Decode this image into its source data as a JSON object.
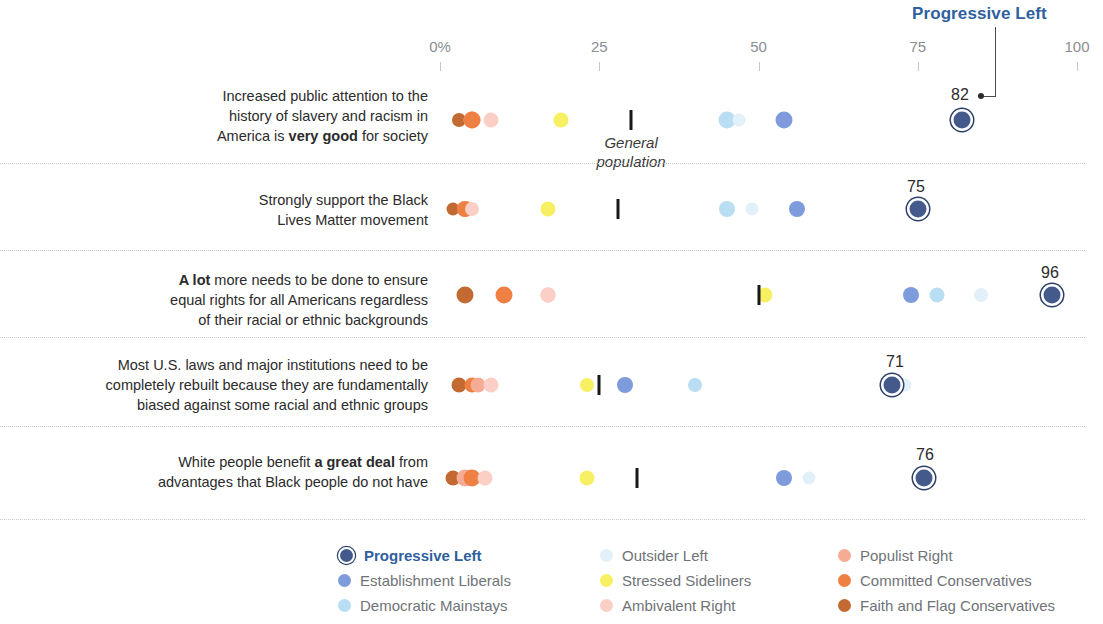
{
  "callout": {
    "title": "Progressive Left",
    "value": "82",
    "color": "#2f5f9e"
  },
  "axis": {
    "ticks": [
      {
        "label": "0%",
        "value": 0
      },
      {
        "label": "25",
        "value": 25
      },
      {
        "label": "50",
        "value": 50
      },
      {
        "label": "75",
        "value": 75
      },
      {
        "label": "100",
        "value": 100
      }
    ],
    "min": 0,
    "max": 100
  },
  "genpop_note": {
    "line1": "General",
    "line2": "population"
  },
  "groups": [
    {
      "key": "progressive_left",
      "label": "Progressive Left",
      "color": "#44598c",
      "ring": true
    },
    {
      "key": "establishment_liberals",
      "label": "Establishment Liberals",
      "color": "#7e9bdc",
      "ring": false
    },
    {
      "key": "democratic_mainstays",
      "label": "Democratic Mainstays",
      "color": "#b9ddf2",
      "ring": false
    },
    {
      "key": "outsider_left",
      "label": "Outsider Left",
      "color": "#e2f0fa",
      "ring": false
    },
    {
      "key": "stressed_sideliners",
      "label": "Stressed Sideliners",
      "color": "#f6f062",
      "ring": false
    },
    {
      "key": "ambivalent_right",
      "label": "Ambivalent Right",
      "color": "#fbcfc6",
      "ring": false
    },
    {
      "key": "populist_right",
      "label": "Populist Right",
      "color": "#f6ab95",
      "ring": false
    },
    {
      "key": "committed_conservatives",
      "label": "Committed Conservatives",
      "color": "#ef8043",
      "ring": false
    },
    {
      "key": "faith_and_flag",
      "label": "Faith and Flag Conservatives",
      "color": "#c26a32",
      "ring": false
    }
  ],
  "legend": {
    "columns": [
      [
        "progressive_left",
        "establishment_liberals",
        "democratic_mainstays"
      ],
      [
        "outsider_left",
        "stressed_sideliners",
        "ambivalent_right"
      ],
      [
        "populist_right",
        "committed_conservatives",
        "faith_and_flag"
      ]
    ],
    "highlight_key": "progressive_left"
  },
  "chart_data": {
    "type": "scatter",
    "title": "",
    "xlabel": "",
    "ylabel": "",
    "xlim": [
      0,
      100
    ],
    "grid": false,
    "legend_position": "bottom",
    "categories": [
      "Increased public attention to the history of slavery and racism in America is very good for society",
      "Strongly support the Black Lives Matter movement",
      "A lot more needs to be done to ensure equal rights for all Americans regardless of their racial or ethnic backgrounds",
      "Most U.S. laws and major institutions need to be completely rebuilt because they are fundamentally biased against some racial and ethnic groups",
      "White people benefit a great deal from advantages that Black people do not have"
    ],
    "series": [
      {
        "name": "Progressive Left",
        "values": [
          82,
          75,
          96,
          71,
          76
        ]
      },
      {
        "name": "Establishment Liberals",
        "values": [
          54,
          56,
          74,
          29,
          54
        ]
      },
      {
        "name": "Democratic Mainstays",
        "values": [
          45,
          46,
          78,
          40,
          47
        ]
      },
      {
        "name": "Outsider Left",
        "values": [
          47,
          49,
          85,
          34,
          51
        ]
      },
      {
        "name": "Stressed Sideliners",
        "values": [
          19,
          17,
          18,
          23,
          23
        ]
      },
      {
        "name": "Ambivalent Right",
        "values": [
          8,
          5,
          17,
          8,
          7
        ]
      },
      {
        "name": "Populist Right",
        "values": [
          5,
          4,
          10,
          6,
          4
        ]
      },
      {
        "name": "Committed Conservatives",
        "values": [
          5,
          4,
          10,
          5,
          5
        ]
      },
      {
        "name": "Faith and Flag Conservatives",
        "values": [
          3,
          2,
          4,
          3,
          2
        ]
      }
    ],
    "general_population": [
      30,
      28,
      50,
      25,
      31
    ]
  },
  "rows": [
    {
      "label_html": "Increased public attention to the<br>history of slavery and racism in<br>America is <b>very good</b> for society",
      "label_top": 86,
      "plot_y": 120,
      "sep_y": 163,
      "value_label": "82",
      "value_label_x": 960,
      "value_label_y": 86,
      "genpop": 30,
      "show_genpop_note": true,
      "dots": [
        {
          "key": "faith_and_flag",
          "x": 3,
          "size": 14
        },
        {
          "key": "populist_right",
          "x": 5,
          "size": 17
        },
        {
          "key": "committed_conservatives",
          "x": 5,
          "size": 17
        },
        {
          "key": "ambivalent_right",
          "x": 8,
          "size": 15
        },
        {
          "key": "stressed_sideliners",
          "x": 19,
          "size": 15
        },
        {
          "key": "democratic_mainstays",
          "x": 45,
          "size": 17
        },
        {
          "key": "outsider_left",
          "x": 47,
          "size": 13
        },
        {
          "key": "establishment_liberals",
          "x": 54,
          "size": 17
        },
        {
          "key": "progressive_left",
          "x": 82,
          "size": 17
        }
      ]
    },
    {
      "label_html": "Strongly support the Black<br>Lives Matter movement",
      "label_top": 190,
      "plot_y": 209,
      "sep_y": 250,
      "value_label": "75",
      "value_label_x": 916,
      "value_label_y": 178,
      "genpop": 28,
      "show_genpop_note": false,
      "dots": [
        {
          "key": "faith_and_flag",
          "x": 2,
          "size": 13
        },
        {
          "key": "populist_right",
          "x": 4,
          "size": 16
        },
        {
          "key": "committed_conservatives",
          "x": 4,
          "size": 16
        },
        {
          "key": "ambivalent_right",
          "x": 5,
          "size": 14
        },
        {
          "key": "stressed_sideliners",
          "x": 17,
          "size": 15
        },
        {
          "key": "democratic_mainstays",
          "x": 45,
          "size": 16
        },
        {
          "key": "outsider_left",
          "x": 49,
          "size": 13
        },
        {
          "key": "establishment_liberals",
          "x": 56,
          "size": 16
        },
        {
          "key": "progressive_left",
          "x": 75,
          "size": 17
        }
      ]
    },
    {
      "label_html": "<b>A lot</b> more needs to be done to ensure<br>equal rights for all Americans regardless<br>of their racial or ethnic backgrounds",
      "label_top": 270,
      "plot_y": 295,
      "sep_y": 337,
      "value_label": "96",
      "value_label_x": 1050,
      "value_label_y": 264,
      "genpop": 50,
      "show_genpop_note": false,
      "dots": [
        {
          "key": "faith_and_flag",
          "x": 4,
          "size": 17
        },
        {
          "key": "committed_conservatives",
          "x": 10,
          "size": 17
        },
        {
          "key": "populist_right",
          "x": 17,
          "size": 15
        },
        {
          "key": "ambivalent_right",
          "x": 17,
          "size": 15
        },
        {
          "key": "stressed_sideliners",
          "x": 51,
          "size": 15
        },
        {
          "key": "establishment_liberals",
          "x": 74,
          "size": 16
        },
        {
          "key": "democratic_mainstays",
          "x": 78,
          "size": 15
        },
        {
          "key": "outsider_left",
          "x": 85,
          "size": 14
        },
        {
          "key": "progressive_left",
          "x": 96,
          "size": 17
        }
      ]
    },
    {
      "label_html": "Most U.S. laws and major institutions need to be<br>completely rebuilt because they are fundamentally<br>biased against some racial and ethnic groups",
      "label_top": 355,
      "plot_y": 385,
      "sep_y": 426,
      "value_label": "71",
      "value_label_x": 895,
      "value_label_y": 353,
      "genpop": 25,
      "show_genpop_note": false,
      "dots": [
        {
          "key": "faith_and_flag",
          "x": 3,
          "size": 15
        },
        {
          "key": "committed_conservatives",
          "x": 5,
          "size": 15
        },
        {
          "key": "populist_right",
          "x": 6,
          "size": 15
        },
        {
          "key": "ambivalent_right",
          "x": 8,
          "size": 15
        },
        {
          "key": "stressed_sideliners",
          "x": 23,
          "size": 14
        },
        {
          "key": "establishment_liberals",
          "x": 29,
          "size": 16
        },
        {
          "key": "democratic_mainstays",
          "x": 40,
          "size": 14
        },
        {
          "key": "outsider_left",
          "x": 73,
          "size": 13
        },
        {
          "key": "progressive_left",
          "x": 71,
          "size": 17
        }
      ]
    },
    {
      "label_html": "White people benefit <b>a great deal</b> from<br>advantages that Black people do not have",
      "label_top": 452,
      "plot_y": 478,
      "sep_y": 519,
      "value_label": "76",
      "value_label_x": 925,
      "value_label_y": 446,
      "genpop": 31,
      "show_genpop_note": false,
      "dots": [
        {
          "key": "faith_and_flag",
          "x": 2,
          "size": 15
        },
        {
          "key": "populist_right",
          "x": 4,
          "size": 17
        },
        {
          "key": "committed_conservatives",
          "x": 5,
          "size": 17
        },
        {
          "key": "ambivalent_right",
          "x": 7,
          "size": 15
        },
        {
          "key": "stressed_sideliners",
          "x": 23,
          "size": 15
        },
        {
          "key": "outsider_left",
          "x": 58,
          "size": 13
        },
        {
          "key": "establishment_liberals",
          "x": 54,
          "size": 16
        },
        {
          "key": "progressive_left",
          "x": 76,
          "size": 17
        }
      ]
    }
  ]
}
